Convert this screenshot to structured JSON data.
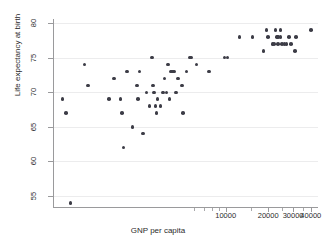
{
  "chart_data": {
    "type": "scatter",
    "title": "",
    "xlabel": "GNP per capita",
    "ylabel": "Life expectancy at birth",
    "xscale": "log",
    "yscale": "linear",
    "xlim": [
      600,
      45000
    ],
    "ylim": [
      53.4,
      80.6
    ],
    "grid": true,
    "legend": false,
    "yticks": [
      55,
      60,
      65,
      70,
      75,
      80
    ],
    "ytick_labels": [
      "55",
      "60",
      "65",
      "70",
      "75",
      "80"
    ],
    "xticks": [
      10000,
      20000,
      30000,
      40000
    ],
    "xtick_labels": [
      "10000",
      "20000",
      "30000",
      "40000"
    ],
    "xminor_ticks": [
      6000,
      7000,
      8000,
      9000,
      15000,
      25000,
      35000
    ],
    "marker_color": "#3c3c46",
    "marker_shape": "circle",
    "points": [
      {
        "x": 700,
        "y": 69
      },
      {
        "x": 740,
        "y": 67
      },
      {
        "x": 800,
        "y": 54
      },
      {
        "x": 1000,
        "y": 74
      },
      {
        "x": 1060,
        "y": 71
      },
      {
        "x": 1500,
        "y": 69
      },
      {
        "x": 1620,
        "y": 72
      },
      {
        "x": 1800,
        "y": 69
      },
      {
        "x": 1850,
        "y": 67
      },
      {
        "x": 1900,
        "y": 62
      },
      {
        "x": 2000,
        "y": 73
      },
      {
        "x": 2200,
        "y": 65
      },
      {
        "x": 2350,
        "y": 71
      },
      {
        "x": 2400,
        "y": 69
      },
      {
        "x": 2450,
        "y": 73
      },
      {
        "x": 2600,
        "y": 64
      },
      {
        "x": 2750,
        "y": 70
      },
      {
        "x": 2900,
        "y": 68
      },
      {
        "x": 3000,
        "y": 75
      },
      {
        "x": 3050,
        "y": 71
      },
      {
        "x": 3100,
        "y": 70
      },
      {
        "x": 3200,
        "y": 68
      },
      {
        "x": 3250,
        "y": 67
      },
      {
        "x": 3300,
        "y": 69
      },
      {
        "x": 3450,
        "y": 68
      },
      {
        "x": 3600,
        "y": 70
      },
      {
        "x": 3700,
        "y": 72
      },
      {
        "x": 3800,
        "y": 70
      },
      {
        "x": 3900,
        "y": 74
      },
      {
        "x": 4000,
        "y": 69
      },
      {
        "x": 4100,
        "y": 73
      },
      {
        "x": 4250,
        "y": 73
      },
      {
        "x": 4350,
        "y": 73
      },
      {
        "x": 4450,
        "y": 70
      },
      {
        "x": 4600,
        "y": 72
      },
      {
        "x": 4900,
        "y": 71
      },
      {
        "x": 5000,
        "y": 67
      },
      {
        "x": 5300,
        "y": 73
      },
      {
        "x": 5600,
        "y": 75
      },
      {
        "x": 5750,
        "y": 75
      },
      {
        "x": 6200,
        "y": 74
      },
      {
        "x": 7600,
        "y": 73
      },
      {
        "x": 9800,
        "y": 75
      },
      {
        "x": 10300,
        "y": 75
      },
      {
        "x": 12500,
        "y": 78
      },
      {
        "x": 15500,
        "y": 78
      },
      {
        "x": 18500,
        "y": 76
      },
      {
        "x": 19500,
        "y": 79
      },
      {
        "x": 20000,
        "y": 78
      },
      {
        "x": 21500,
        "y": 77
      },
      {
        "x": 22000,
        "y": 77
      },
      {
        "x": 22500,
        "y": 79
      },
      {
        "x": 23000,
        "y": 78
      },
      {
        "x": 23500,
        "y": 78
      },
      {
        "x": 23500,
        "y": 77
      },
      {
        "x": 24500,
        "y": 79
      },
      {
        "x": 24500,
        "y": 78
      },
      {
        "x": 25000,
        "y": 77
      },
      {
        "x": 26000,
        "y": 77
      },
      {
        "x": 27000,
        "y": 77
      },
      {
        "x": 28000,
        "y": 78
      },
      {
        "x": 29000,
        "y": 77
      },
      {
        "x": 31000,
        "y": 76
      },
      {
        "x": 31500,
        "y": 78
      },
      {
        "x": 40000,
        "y": 79
      }
    ]
  },
  "axes": {
    "y_title": "Life expectancy at birth",
    "x_title": "GNP per capita"
  }
}
